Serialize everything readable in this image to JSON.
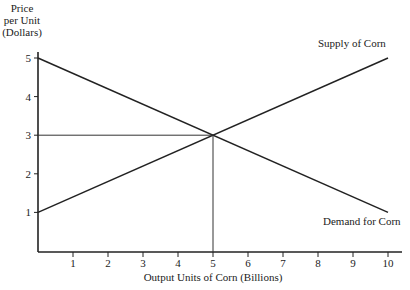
{
  "chart_data": {
    "type": "line",
    "title": "",
    "xlabel": "Output Units of Corn (Billions)",
    "ylabel_lines": [
      "Price",
      "per Unit",
      "(Dollars)"
    ],
    "xlim": [
      0,
      10
    ],
    "ylim": [
      0,
      5
    ],
    "x_ticks": [
      "1",
      "2",
      "3",
      "4",
      "5",
      "6",
      "7",
      "8",
      "9",
      "10"
    ],
    "y_ticks": [
      "1",
      "2",
      "3",
      "4",
      "5"
    ],
    "grid": false,
    "series": [
      {
        "name": "Supply of Corn",
        "x": [
          0,
          10
        ],
        "y": [
          1,
          5
        ]
      },
      {
        "name": "Demand for Corn",
        "x": [
          0,
          10
        ],
        "y": [
          5,
          1
        ]
      }
    ],
    "annotations": [
      {
        "type": "equilibrium-guides",
        "x": 5,
        "y": 3
      }
    ],
    "legend_position": "inline labels at line ends"
  }
}
